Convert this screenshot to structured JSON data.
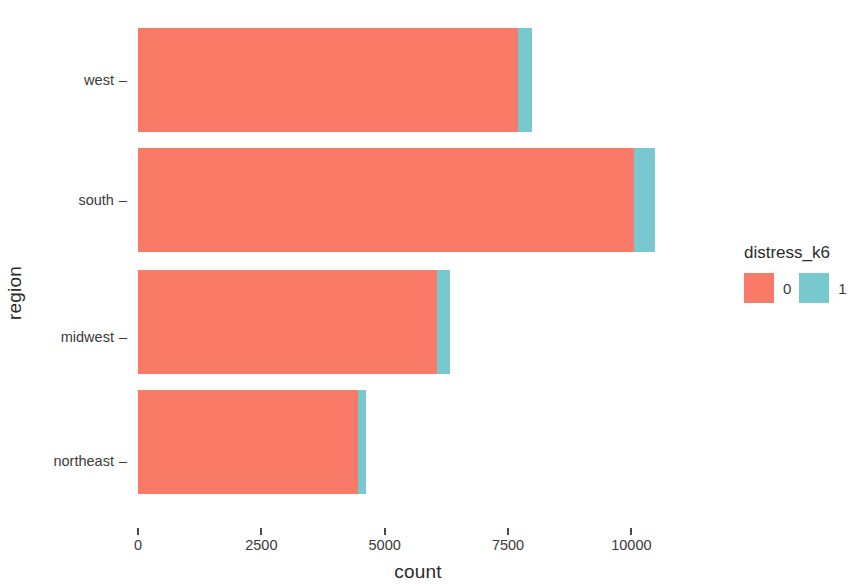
{
  "chart_data": {
    "type": "bar",
    "orientation": "horizontal",
    "stacked": true,
    "title": "",
    "xlabel": "count",
    "ylabel": "region",
    "categories": [
      "northeast",
      "midwest",
      "south",
      "west"
    ],
    "category_order_top_to_bottom": [
      "west",
      "south",
      "midwest",
      "northeast"
    ],
    "series": [
      {
        "name": "0",
        "color": "#F8766D",
        "values": [
          4450,
          6050,
          10050,
          7700
        ]
      },
      {
        "name": "1",
        "color": "#00BFC4",
        "values": [
          180,
          270,
          420,
          290
        ]
      }
    ],
    "totals": [
      4630,
      6320,
      10470,
      7990
    ],
    "xlim": [
      0,
      11350
    ],
    "xticks": [
      0,
      2500,
      5000,
      7500,
      10000
    ],
    "xtick_labels": [
      "0",
      "2500",
      "5000",
      "7500",
      "10000"
    ],
    "grid": false,
    "legend": {
      "title": "distress_k6",
      "position": "right",
      "entries": [
        {
          "label": "0",
          "color": "#F8766D"
        },
        {
          "label": "1",
          "color": "#00BFC4"
        }
      ]
    }
  },
  "axes": {
    "y_title": "region",
    "x_title": "count",
    "y_tick_labels": [
      "west",
      "south",
      "midwest",
      "northeast"
    ],
    "x_tick_labels": [
      "0",
      "2500",
      "5000",
      "7500",
      "10000"
    ]
  },
  "legend": {
    "title": "distress_k6",
    "labels": [
      "0",
      "1"
    ]
  },
  "colors": {
    "series_0": "#F8766D",
    "series_1": "#00BFC4",
    "background": "#FFFFFF",
    "text": "#3A3A3A"
  }
}
